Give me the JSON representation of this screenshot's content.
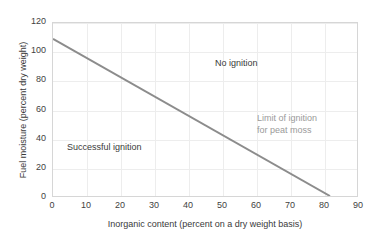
{
  "chart_data": {
    "type": "line",
    "title": "",
    "subtitle": "",
    "xlabel": "Inorganic content (percent on a dry weight basis)",
    "ylabel": "Fuel moisture (percent dry weight)",
    "xlim": [
      0,
      90
    ],
    "ylim": [
      0,
      120
    ],
    "xticks": [
      0,
      10,
      20,
      30,
      40,
      50,
      60,
      70,
      80,
      90
    ],
    "yticks": [
      0,
      20,
      40,
      60,
      80,
      100,
      120
    ],
    "grid": true,
    "legend_position": "none",
    "series": [
      {
        "name": "Limit of ignition for peat moss",
        "color": "#8c8c8c",
        "x": [
          0,
          82
        ],
        "values": [
          109,
          0
        ]
      }
    ],
    "annotations": [
      {
        "name": "no-ignition",
        "text": "No ignition",
        "x": 37,
        "y": 88,
        "color": "#3a3a3a"
      },
      {
        "name": "successful-ignition",
        "text": "Successful ignition",
        "x": 5,
        "y": 31,
        "color": "#3a3a3a"
      },
      {
        "name": "limit-of-ignition",
        "text": "Limit of ignition\nfor peat moss",
        "x": 50,
        "y": 51,
        "color": "#9a9a9a"
      }
    ]
  },
  "axis": {
    "x_tick_labels": [
      "0",
      "10",
      "20",
      "30",
      "40",
      "50",
      "60",
      "70",
      "80",
      "90"
    ],
    "y_tick_labels": [
      "0",
      "20",
      "40",
      "60",
      "80",
      "100",
      "120"
    ],
    "x_title": "Inorganic content (percent on a dry weight basis)",
    "y_title": "Fuel moisture (percent dry weight)"
  },
  "annotations": {
    "no_ignition": "No ignition",
    "successful_ignition": "Successful ignition",
    "limit_line_1": "Limit of ignition",
    "limit_line_2": "for peat moss"
  },
  "colors": {
    "series_line": "#8c8c8c",
    "grid": "#ededed",
    "axis_border": "#d6d6d6",
    "text": "#3a3a3a",
    "muted_text": "#9a9a9a",
    "background": "#ffffff"
  }
}
